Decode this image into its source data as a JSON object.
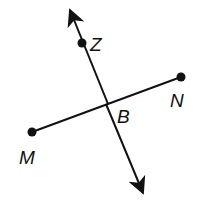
{
  "diagram": {
    "type": "geometry",
    "colors": {
      "stroke": "#111111",
      "background": "#ffffff"
    },
    "line": {
      "name": "line through Z and B",
      "arrow_start": [
        68,
        6
      ],
      "arrow_end": [
        145,
        197
      ]
    },
    "segment": {
      "name": "segment MN",
      "from": "M",
      "to": "N"
    },
    "points": [
      {
        "id": "Z",
        "label": "Z",
        "x": 82,
        "y": 43,
        "dot": true
      },
      {
        "id": "M",
        "label": "M",
        "x": 32,
        "y": 132,
        "dot": true
      },
      {
        "id": "N",
        "label": "N",
        "x": 181,
        "y": 77,
        "dot": true
      },
      {
        "id": "B",
        "label": "B",
        "x": 106,
        "y": 104,
        "dot": false
      }
    ]
  }
}
